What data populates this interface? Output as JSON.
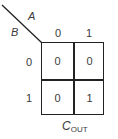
{
  "kmap": {
    "var_col": "A",
    "var_row": "B",
    "col_headers": [
      "0",
      "1"
    ],
    "row_headers": [
      "0",
      "1"
    ],
    "cells": [
      [
        "0",
        "0"
      ],
      [
        "0",
        "1"
      ]
    ],
    "output_label": "C",
    "output_subscript": "OUT"
  }
}
